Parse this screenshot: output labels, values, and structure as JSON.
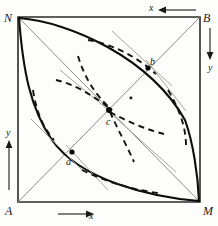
{
  "figure": {
    "background_color": "#fdfdfb",
    "stroke_color": "#111111",
    "diagonal_color": "#7a7a7a",
    "tangent_color": "#8a8a8a",
    "dashed_color": "#1a1a1a"
  },
  "square": {
    "left": 18,
    "top": 17,
    "right": 200,
    "bottom": 202,
    "vertices": [
      {
        "name": "N",
        "label": "N",
        "position": "top-left",
        "x": 18,
        "y": 17
      },
      {
        "name": "B",
        "label": "B",
        "position": "top-right",
        "x": 200,
        "y": 17
      },
      {
        "name": "A",
        "label": "A",
        "position": "bottom-left",
        "x": 18,
        "y": 202
      },
      {
        "name": "M",
        "label": "M",
        "position": "bottom-right",
        "x": 200,
        "y": 202
      }
    ]
  },
  "points": [
    {
      "name": "a",
      "label": "a",
      "x": 72,
      "y": 152,
      "description": "lower-left intersection on diagonal A-B"
    },
    {
      "name": "b",
      "label": "b",
      "x": 148,
      "y": 68,
      "description": "upper-right intersection on diagonal A-B"
    },
    {
      "name": "c",
      "label": "c",
      "x": 109,
      "y": 110,
      "description": "centre intersection of both diagonals"
    },
    {
      "name": "dot",
      "label": "",
      "x": 131,
      "y": 98,
      "description": "small isolated marker dot"
    }
  ],
  "axes": [
    {
      "name": "x-bottom",
      "label": "x",
      "direction": "right",
      "edge": "bottom"
    },
    {
      "name": "x-top",
      "label": "x",
      "direction": "left",
      "edge": "top"
    },
    {
      "name": "y-left",
      "label": "y",
      "direction": "up",
      "edge": "left"
    },
    {
      "name": "y-right",
      "label": "y",
      "direction": "down",
      "edge": "right"
    }
  ],
  "curves": {
    "solid_arcs": [
      {
        "name": "arc-N-M-lower",
        "from": "N",
        "to": "M",
        "bulge": "left-down"
      },
      {
        "name": "arc-N-M-upper",
        "from": "N",
        "to": "M",
        "bulge": "right-up"
      }
    ],
    "diagonals": [
      {
        "name": "diagonal-A-B",
        "from": "A",
        "to": "B"
      },
      {
        "name": "diagonal-N-M",
        "from": "N",
        "to": "M"
      }
    ],
    "dashed_family_count": 7,
    "tangent_count": 6
  }
}
